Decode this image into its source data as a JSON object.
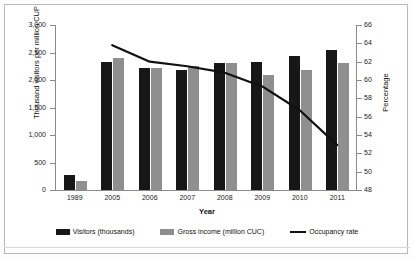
{
  "chart_data": {
    "type": "bar",
    "title": "",
    "xlabel": "Year",
    "ylabel": "Thousand visitors per million CUP",
    "ylabel_secondary": "Percentage",
    "categories": [
      "1989",
      "2005",
      "2006",
      "2007",
      "2008",
      "2009",
      "2010",
      "2011"
    ],
    "ylim": [
      0,
      3000
    ],
    "yticks": [
      "0",
      "500",
      "1,000",
      "1,500",
      "2,000",
      "2,500",
      "3,000"
    ],
    "ytick_values": [
      0,
      500,
      1000,
      1500,
      2000,
      2500,
      3000
    ],
    "ylim_secondary": [
      48,
      66
    ],
    "yticks_secondary": [
      "48",
      "50",
      "52",
      "54",
      "56",
      "58",
      "60",
      "62",
      "64",
      "66"
    ],
    "ytick_values_secondary": [
      48,
      50,
      52,
      54,
      56,
      58,
      60,
      62,
      64,
      66
    ],
    "grid": false,
    "legend_position": "bottom",
    "series": [
      {
        "name": "Visitors (thousands)",
        "type": "bar",
        "axis": "left",
        "color": "#171717",
        "values": [
          270,
          2325,
          2220,
          2180,
          2310,
          2325,
          2435,
          2545
        ]
      },
      {
        "name": "Gross income (million CUC)",
        "type": "bar",
        "axis": "left",
        "color": "#8f8f8f",
        "values": [
          165,
          2400,
          2220,
          2255,
          2310,
          2090,
          2180,
          2310
        ]
      },
      {
        "name": "Occupancy rate",
        "type": "line",
        "axis": "right",
        "color": "#111111",
        "values": [
          null,
          63.8,
          62.0,
          61.5,
          60.8,
          59.3,
          56.7,
          52.9
        ]
      }
    ]
  },
  "legend": {
    "items": [
      {
        "label": "Visitors (thousands)",
        "swatch": "black-bar-swatch"
      },
      {
        "label": "Gross income (million CUC)",
        "swatch": "gray-bar-swatch"
      },
      {
        "label": "Occupancy rate",
        "swatch": "black-line-swatch"
      }
    ]
  }
}
